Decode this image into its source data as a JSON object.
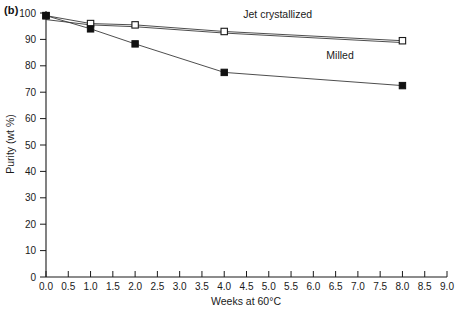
{
  "panel": {
    "label": "(b)"
  },
  "chart_data": {
    "type": "line",
    "title": "",
    "subtitle": "",
    "xlabel": "Weeks at 60°C",
    "ylabel": "Purity (wt %)",
    "xlim": [
      0.0,
      9.0
    ],
    "ylim": [
      0,
      100
    ],
    "xticks": [
      "0.0",
      "0.5",
      "1.0",
      "1.5",
      "2.0",
      "2.5",
      "3.0",
      "3.5",
      "4.0",
      "4.5",
      "5.0",
      "5.5",
      "6.0",
      "6.5",
      "7.0",
      "7.5",
      "8.0",
      "8.5",
      "9.0"
    ],
    "xtick_values": [
      0.0,
      0.5,
      1.0,
      1.5,
      2.0,
      2.5,
      3.0,
      3.5,
      4.0,
      4.5,
      5.0,
      5.5,
      6.0,
      6.5,
      7.0,
      7.5,
      8.0,
      8.5,
      9.0
    ],
    "yticks": [
      "0",
      "10",
      "20",
      "30",
      "40",
      "50",
      "60",
      "70",
      "80",
      "90",
      "100"
    ],
    "ytick_values": [
      0,
      10,
      20,
      30,
      40,
      50,
      60,
      70,
      80,
      90,
      100
    ],
    "grid": false,
    "legend_position": "inline-annotation",
    "series": [
      {
        "name": "Jet crystallized",
        "marker": "open-square",
        "x": [
          0.0,
          1.0,
          2.0,
          4.0,
          8.0
        ],
        "values": [
          99.0,
          96.0,
          95.5,
          93.0,
          89.5
        ]
      },
      {
        "name": "Jet crystallized (replicate)",
        "marker": "none",
        "x": [
          0.0,
          1.0,
          2.0,
          4.0,
          8.0
        ],
        "values": [
          97.5,
          95.5,
          94.8,
          92.4,
          88.8
        ]
      },
      {
        "name": "Milled",
        "marker": "filled-square",
        "x": [
          0.0,
          1.0,
          2.0,
          4.0,
          8.0
        ],
        "values": [
          99.0,
          94.0,
          88.3,
          77.5,
          72.5
        ]
      }
    ],
    "annotations": [
      {
        "text": "Jet crystallized",
        "x": 5.2,
        "y": 98.0
      },
      {
        "text": "Milled",
        "x": 6.6,
        "y": 82.5
      }
    ]
  }
}
